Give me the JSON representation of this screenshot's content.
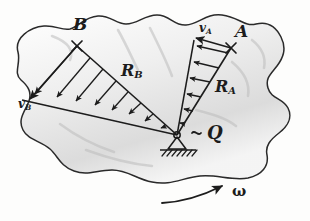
{
  "diagram": {
    "style": "hand-drawn pencil sketch on white paper",
    "colors": {
      "ink": "#1c1c1c",
      "paper": "#fdfdfc",
      "shading": "#c9c9c9",
      "outline": "#2a2a2a"
    },
    "labels": {
      "point_a": "A",
      "point_b": "B",
      "pivot": "Q",
      "pivot_tilde": "~",
      "velocity_a": "v",
      "velocity_a_sub": "A",
      "velocity_b": "v",
      "velocity_b_sub": "B",
      "radius_a": "R",
      "radius_a_sub": "A",
      "radius_b": "R",
      "radius_b_sub": "B",
      "omega": "ω"
    },
    "geometry": {
      "pivot_q": [
        177,
        135
      ],
      "point_a": [
        231,
        48
      ],
      "point_b": [
        77,
        46
      ],
      "v_a_tip": [
        196,
        38
      ],
      "v_b_tip": [
        22,
        100
      ],
      "radius_a_arrows": 6,
      "radius_b_arrows": 8,
      "ground_hatch_y": 150,
      "omega_arc_start": [
        165,
        202
      ],
      "omega_arc_end": [
        228,
        185
      ]
    }
  }
}
